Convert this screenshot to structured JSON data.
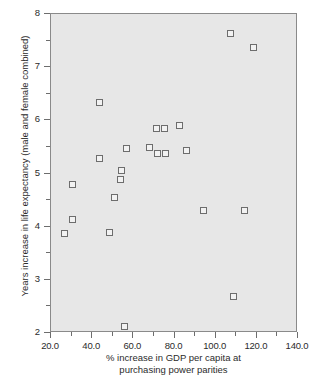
{
  "chart_data": {
    "type": "scatter",
    "title": "",
    "xlabel": "% increase in GDP per capita at purchasing power parities",
    "xlabel_line1": "% increase in GDP per capita at",
    "xlabel_line2": "purchasing power parities",
    "ylabel": "Years increase in life expectancy (male and female combined)",
    "xlim": [
      20.0,
      140.0
    ],
    "ylim": [
      2,
      8
    ],
    "xticks": [
      20.0,
      40.0,
      60.0,
      80.0,
      100.0,
      120.0,
      140.0
    ],
    "xtick_labels": [
      "20.0",
      "40.0",
      "60.0",
      "80.0",
      "100.0",
      "120.0",
      "140.0"
    ],
    "xminor_ticks": [
      30.0,
      50.0,
      70.0,
      90.0,
      110.0,
      130.0
    ],
    "yticks": [
      2,
      3,
      4,
      5,
      6,
      7,
      8
    ],
    "ytick_labels": [
      "2",
      "3",
      "4",
      "5",
      "6",
      "7",
      "8"
    ],
    "yminor_ticks": [
      2.5,
      3.5,
      4.5,
      5.5,
      6.5,
      7.5
    ],
    "grid": false,
    "legend": null,
    "marker": "open-square",
    "plot_background": "#e7e7e7",
    "marker_edge_color": "#6d6d6d",
    "marker_face_color": "#f2f2f2",
    "points": [
      {
        "x": 26.8,
        "y": 3.86
      },
      {
        "x": 30.5,
        "y": 4.79
      },
      {
        "x": 30.7,
        "y": 4.12
      },
      {
        "x": 43.9,
        "y": 6.32
      },
      {
        "x": 43.9,
        "y": 5.27
      },
      {
        "x": 48.5,
        "y": 3.89
      },
      {
        "x": 51.3,
        "y": 4.53
      },
      {
        "x": 54.1,
        "y": 4.88
      },
      {
        "x": 54.6,
        "y": 5.04
      },
      {
        "x": 56.0,
        "y": 2.11
      },
      {
        "x": 57.1,
        "y": 5.47
      },
      {
        "x": 68.3,
        "y": 5.48
      },
      {
        "x": 71.7,
        "y": 5.84
      },
      {
        "x": 72.2,
        "y": 5.37
      },
      {
        "x": 75.6,
        "y": 5.84
      },
      {
        "x": 76.1,
        "y": 5.37
      },
      {
        "x": 82.9,
        "y": 5.89
      },
      {
        "x": 85.9,
        "y": 5.42
      },
      {
        "x": 94.3,
        "y": 4.3
      },
      {
        "x": 107.3,
        "y": 7.62
      },
      {
        "x": 108.8,
        "y": 2.68
      },
      {
        "x": 114.2,
        "y": 4.3
      },
      {
        "x": 118.5,
        "y": 7.36
      }
    ]
  }
}
